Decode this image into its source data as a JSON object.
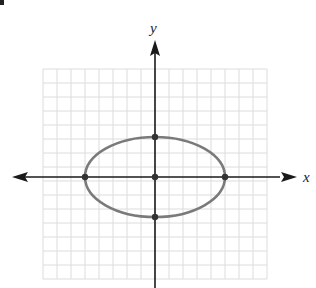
{
  "diagram": {
    "type": "coordinate-plane-ellipse",
    "axes": {
      "x_label": "x",
      "y_label": "y",
      "tick_labels_shown": false
    },
    "grid": {
      "cell_px": 14,
      "left_px": 43,
      "top_px": 69,
      "cols": 16,
      "rows": 15,
      "line_color": "#dcdcdc"
    },
    "origin_px": {
      "x": 155,
      "y": 177
    },
    "ellipse": {
      "center_grid": [
        0,
        0
      ],
      "semi_horizontal_grid_units": 5,
      "semi_vertical_grid_units": 3,
      "rx_px": 70,
      "ry_px": 40,
      "stroke": "#7a7a7a"
    },
    "points_grid": [
      {
        "name": "center",
        "x": 0,
        "y": 0
      },
      {
        "name": "left-vertex",
        "x": -5,
        "y": 0
      },
      {
        "name": "right-vertex",
        "x": 5,
        "y": 0
      },
      {
        "name": "top-co-vertex",
        "x": 0,
        "y": 3
      },
      {
        "name": "bottom-co-vertex",
        "x": 0,
        "y": -3
      }
    ],
    "colors": {
      "axis": "#1a1a1a",
      "point": "#333333"
    }
  }
}
